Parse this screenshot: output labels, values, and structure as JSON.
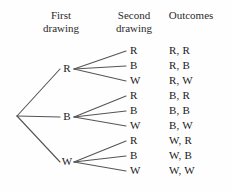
{
  "headers": {
    "first": "First\ndrawing",
    "second": "Second\ndrawing",
    "outcomes": "Outcomes"
  },
  "level1": [
    {
      "label": "R"
    },
    {
      "label": "B"
    },
    {
      "label": "W"
    }
  ],
  "level2": [
    {
      "label": "R"
    },
    {
      "label": "B"
    },
    {
      "label": "W"
    },
    {
      "label": "R"
    },
    {
      "label": "B"
    },
    {
      "label": "W"
    },
    {
      "label": "R"
    },
    {
      "label": "B"
    },
    {
      "label": "W"
    }
  ],
  "outcomes": [
    {
      "label": "R, R"
    },
    {
      "label": "R, B"
    },
    {
      "label": "R, W"
    },
    {
      "label": "B, R"
    },
    {
      "label": "B, B"
    },
    {
      "label": "B, W"
    },
    {
      "label": "W, R"
    },
    {
      "label": "W, B"
    },
    {
      "label": "W, W"
    }
  ],
  "style": {
    "edge_color": "#555555",
    "text_color": "#1a1a1a",
    "background": "#fefefe"
  }
}
